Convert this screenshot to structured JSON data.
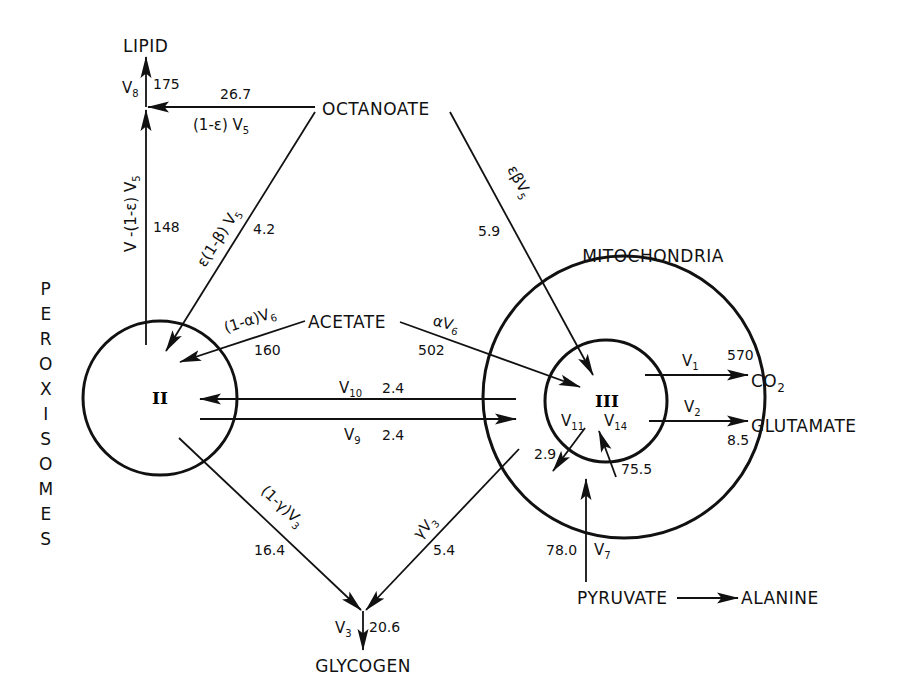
{
  "compartments": {
    "peroxisomes": {
      "label": "PEROXISOMES",
      "letters": [
        "P",
        "E",
        "R",
        "O",
        "X",
        "I",
        "S",
        "O",
        "M",
        "E",
        "S"
      ],
      "pool": "II"
    },
    "mitochondria": {
      "label": "MITOCHONDRIA",
      "pool": "III"
    }
  },
  "metabolites": {
    "lipid": "LIPID",
    "octanoate": "OCTANOATE",
    "acetate": "ACETATE",
    "co2": "CO",
    "co2_sub": "2",
    "glutamate": "GLUTAMATE",
    "glycogen": "GLYCOGEN",
    "pyruvate": "PYRUVATE",
    "alanine": "ALANINE"
  },
  "fluxes": {
    "v8": {
      "symbol": "V",
      "sub": "8",
      "value": "175"
    },
    "oct_to_lipid": {
      "expr": "(1-ε) V",
      "sub": "5",
      "value": "26.7"
    },
    "perox_to_lipid": {
      "expr": "V  -(1-ε) V",
      "sub": "5",
      "value": "148"
    },
    "oct_to_perox": {
      "expr": "ε(1-β) V",
      "sub": "5",
      "value": "4.2"
    },
    "oct_to_mito": {
      "expr": "εβV",
      "sub": "5",
      "value": "5.9"
    },
    "acetate_to_perox": {
      "expr": "(1-α)V",
      "sub": "6",
      "value": "160"
    },
    "acetate_to_mito": {
      "expr": "αV",
      "sub": "6",
      "value": "502"
    },
    "v10": {
      "symbol": "V",
      "sub": "10",
      "value": "2.4"
    },
    "v9": {
      "symbol": "V",
      "sub": "9",
      "value": "2.4"
    },
    "v1": {
      "symbol": "V",
      "sub": "1",
      "value": "570"
    },
    "v2": {
      "symbol": "V",
      "sub": "2",
      "value": "8.5"
    },
    "v11": {
      "symbol": "V",
      "sub": "11",
      "value": "2.9"
    },
    "v14": {
      "symbol": "V",
      "sub": "14",
      "value": "75.5"
    },
    "v7": {
      "symbol": "V",
      "sub": "7",
      "value": "78.0"
    },
    "perox_to_glycogen": {
      "expr": "(1-γ)V",
      "sub": "3",
      "value": "16.4"
    },
    "mito_to_glycogen": {
      "expr": "γV",
      "sub": "3",
      "value": "5.4"
    },
    "v3": {
      "symbol": "V",
      "sub": "3",
      "value": "20.6"
    }
  }
}
